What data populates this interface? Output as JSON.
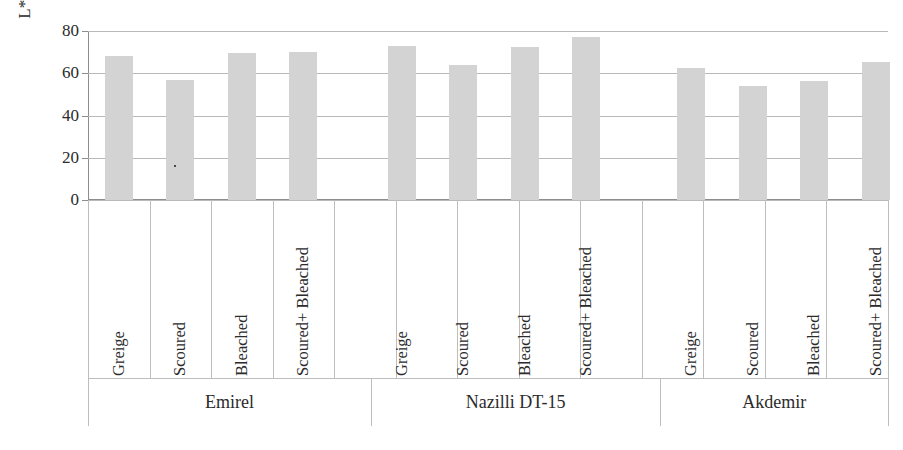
{
  "chart_data": {
    "type": "bar",
    "title": "",
    "xlabel": "",
    "ylabel": "L* (lightness)",
    "ylim": [
      0,
      80
    ],
    "yticks": [
      0,
      20,
      40,
      60,
      80
    ],
    "ytick_labels": [
      "0",
      "20",
      "40",
      "60",
      "80"
    ],
    "grid": true,
    "legend": "none",
    "categories": [
      "Greige",
      "Scoured",
      "Bleached",
      "Scoured+ Bleached"
    ],
    "groups": [
      "Emirel",
      "Nazilli DT-15",
      "Akdemir"
    ],
    "series": [
      {
        "name": "Emirel",
        "values": [
          68,
          57,
          69.5,
          70
        ]
      },
      {
        "name": "Nazilli DT-15",
        "values": [
          73,
          64,
          72.5,
          77
        ]
      },
      {
        "name": "Akdemir",
        "values": [
          62.5,
          54,
          56.5,
          65.5
        ]
      }
    ],
    "bars": [
      {
        "group": "Emirel",
        "category": "Greige",
        "value": 68
      },
      {
        "group": "Emirel",
        "category": "Scoured",
        "value": 57
      },
      {
        "group": "Emirel",
        "category": "Bleached",
        "value": 69.5
      },
      {
        "group": "Emirel",
        "category": "Scoured+ Bleached",
        "value": 70
      },
      {
        "group": "Nazilli DT-15",
        "category": "Greige",
        "value": 73
      },
      {
        "group": "Nazilli DT-15",
        "category": "Scoured",
        "value": 64
      },
      {
        "group": "Nazilli DT-15",
        "category": "Bleached",
        "value": 72.5
      },
      {
        "group": "Nazilli DT-15",
        "category": "Scoured+ Bleached",
        "value": 77
      },
      {
        "group": "Akdemir",
        "category": "Greige",
        "value": 62.5
      },
      {
        "group": "Akdemir",
        "category": "Scoured",
        "value": 54
      },
      {
        "group": "Akdemir",
        "category": "Bleached",
        "value": 56.5
      },
      {
        "group": "Akdemir",
        "category": "Scoured+ Bleached",
        "value": 65.5
      }
    ],
    "colors": {
      "bar_fill": "#d3d3d3",
      "gridline": "#b9b9b9",
      "axis": "#8d8d8d",
      "text": "#2b2b2b",
      "background": "#ffffff"
    }
  }
}
